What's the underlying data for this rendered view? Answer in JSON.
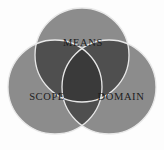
{
  "diagram": {
    "type": "venn-3-set",
    "title": "",
    "background_color": "#fdfdfd",
    "base_fill": "#8c8c8c",
    "pair_overlap_fill": "#4f4f4f",
    "center_overlap_fill": "#3a3a3a",
    "outline_color": "#e8e8e8",
    "label_color": "#1c1c1c",
    "sets": [
      {
        "id": "means",
        "label": "MEANS",
        "position": "top",
        "cx": 82,
        "cy": 55,
        "r": 47
      },
      {
        "id": "scope",
        "label": "SCOPE",
        "position": "bottom-left",
        "cx": 55,
        "cy": 87,
        "r": 47
      },
      {
        "id": "domain",
        "label": "DOMAIN",
        "position": "bottom-right",
        "cx": 109,
        "cy": 87,
        "r": 47
      }
    ],
    "label_positions": [
      {
        "id": "means",
        "x": 83,
        "y": 44
      },
      {
        "id": "scope",
        "x": 47,
        "y": 98
      },
      {
        "id": "domain",
        "x": 121,
        "y": 98
      }
    ]
  }
}
